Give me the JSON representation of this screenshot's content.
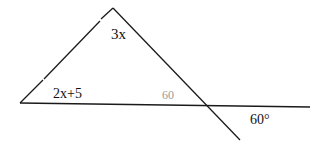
{
  "diagram": {
    "type": "triangle with transversal",
    "labels": {
      "apex_angle": "3x",
      "left_angle": "2x+5",
      "interior_right_angle": "60",
      "exterior_angle": "60°"
    },
    "colors": {
      "line": "#1a1a1a",
      "label": "#111111",
      "faint_label": "#9a9a9a"
    }
  }
}
